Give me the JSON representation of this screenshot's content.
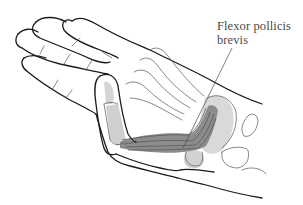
{
  "figure": {
    "label": {
      "line1": "Flexor pollicis",
      "line2": "brevis"
    },
    "colors": {
      "outline": "#1a1a1a",
      "inner_lines": "#555555",
      "muscle_fill": "#8c8c8c",
      "muscle_dark": "#5a5a5a",
      "bone_fill": "#c8c8c8",
      "shadow_fill": "#d6d6d6",
      "label_text": "#4a4a4a",
      "background": "#ffffff"
    }
  }
}
